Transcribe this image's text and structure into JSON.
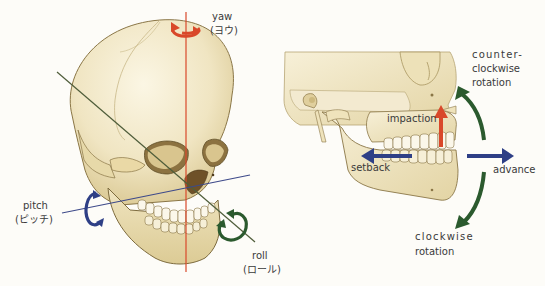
{
  "colors": {
    "background": "#fdfcf8",
    "bone_light": "#f3ebcf",
    "bone_mid": "#e4d6a8",
    "bone_shadow": "#b8a26a",
    "bone_outline": "#7d6b3e",
    "yaw": "#d9482a",
    "pitch": "#2e3f86",
    "roll": "#2b5a2e",
    "impaction": "#d9482a",
    "translation": "#2e3f86",
    "rotation": "#2b5a2e",
    "text": "#3a3a3a"
  },
  "left_panel": {
    "title": "Skull rotation axes",
    "yaw": {
      "label": "yaw",
      "label_jp": "(ヨウ)"
    },
    "pitch": {
      "label": "pitch",
      "label_jp": "(ピッチ)"
    },
    "roll": {
      "label": "roll",
      "label_jp": "(ロール)"
    }
  },
  "right_panel": {
    "title": "Jaw movements",
    "impaction": {
      "label": "impaction"
    },
    "setback": {
      "label": "setback"
    },
    "advance": {
      "label": "advance"
    },
    "ccw_rotation": {
      "label_line1": "counter-",
      "label_line2": "clockwise",
      "label_line3": "rotation"
    },
    "cw_rotation": {
      "label_line1": "clockwise",
      "label_line2": "rotation"
    }
  }
}
